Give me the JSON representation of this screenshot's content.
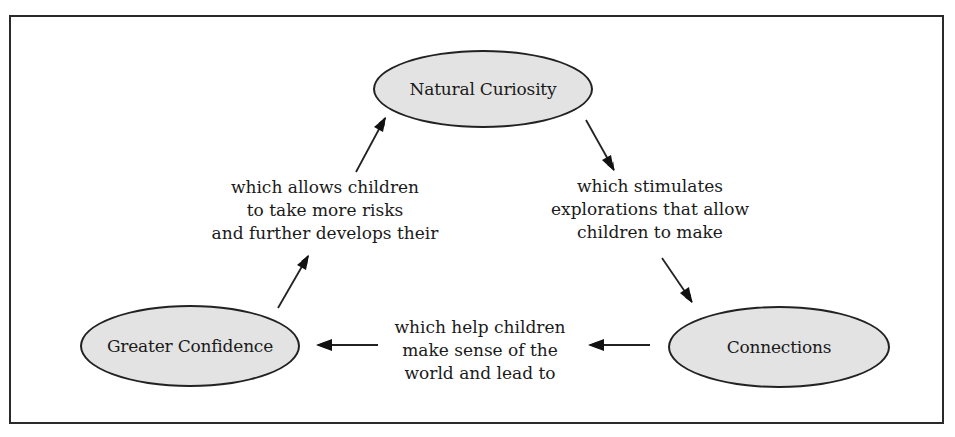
{
  "diagram": {
    "type": "cycle",
    "nodes": [
      {
        "id": "natural-curiosity",
        "label": "Natural Curiosity"
      },
      {
        "id": "connections",
        "label": "Connections"
      },
      {
        "id": "greater-confidence",
        "label": "Greater Confidence"
      }
    ],
    "edges": [
      {
        "from": "natural-curiosity",
        "to": "connections",
        "lines": [
          "which stimulates",
          "explorations that allow",
          "children to make"
        ]
      },
      {
        "from": "connections",
        "to": "greater-confidence",
        "lines": [
          "which help children",
          "make sense of the",
          "world and lead to"
        ]
      },
      {
        "from": "greater-confidence",
        "to": "natural-curiosity",
        "lines": [
          "which allows children",
          "to take more risks",
          "and further develops their"
        ]
      }
    ],
    "colors": {
      "node_fill": "#e3e3e3",
      "stroke": "#222222",
      "text": "#1a1a1a"
    }
  }
}
